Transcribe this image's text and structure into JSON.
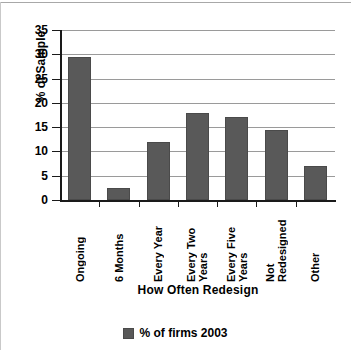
{
  "chart_data": {
    "type": "bar",
    "title": "",
    "subtitle": "",
    "categories": [
      "Ongoing",
      "6 Months",
      "Every Year",
      "Every Two Years",
      "Every Five Years",
      "Not Redesigned",
      "Other"
    ],
    "category_lines": [
      [
        "Ongoing"
      ],
      [
        "6 Months"
      ],
      [
        "Every Year"
      ],
      [
        "Every Two",
        "Years"
      ],
      [
        "Every Five",
        "Years"
      ],
      [
        "Not",
        "Redesigned"
      ],
      [
        "Other"
      ]
    ],
    "values": [
      29.5,
      2.5,
      11.9,
      18.0,
      17.0,
      14.5,
      7.0
    ],
    "series": [
      {
        "name": "% of firms 2003",
        "values": [
          29.5,
          2.5,
          11.9,
          18.0,
          17.0,
          14.5,
          7.0
        ],
        "color": "#595959"
      }
    ],
    "xlabel": "How Often Redesign",
    "ylabel": "% of Sample",
    "ylim": [
      0,
      35
    ],
    "ytick_values": [
      0,
      5,
      10,
      15,
      20,
      25,
      30,
      35
    ],
    "ytick_labels": [
      "0",
      "5",
      "10",
      "15",
      "20",
      "25",
      "30",
      "35"
    ],
    "grid": "horizontal",
    "legend_position": "bottom-center",
    "legend_entries": [
      {
        "label": "% of firms 2003",
        "color": "#595959"
      }
    ]
  },
  "colors": {
    "bar_fill": "#595959",
    "bar_edge": "#4a4a4a",
    "gridline": "#9a9a9a",
    "axis": "#1a1a1a",
    "background": "#ffffff",
    "border_rule": "#a8a8a8"
  },
  "legend": {
    "label": "% of firms 2003"
  },
  "axes": {
    "x_title": "How Often Redesign",
    "y_title": "% of Sample"
  }
}
